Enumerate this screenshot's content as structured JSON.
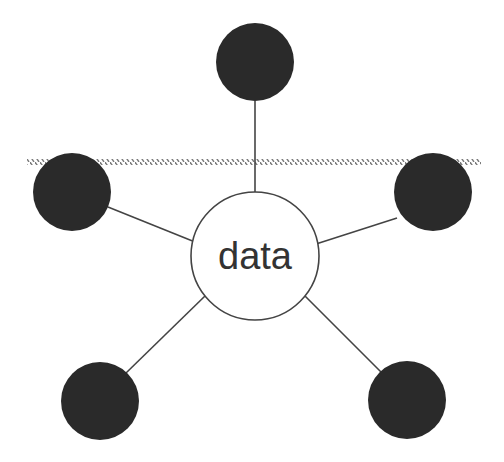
{
  "diagram": {
    "type": "hub-and-spoke",
    "center": {
      "label": "data",
      "cx": 255,
      "cy": 256,
      "r": 64,
      "fill": "#ffffff",
      "stroke": "#444444"
    },
    "satellites": [
      {
        "id": "top",
        "cx": 255,
        "cy": 62,
        "r": 39
      },
      {
        "id": "left",
        "cx": 72,
        "cy": 192,
        "r": 39
      },
      {
        "id": "right",
        "cx": 433,
        "cy": 192,
        "r": 39
      },
      {
        "id": "bottom-left",
        "cx": 100,
        "cy": 401,
        "r": 39
      },
      {
        "id": "bottom-right",
        "cx": 407,
        "cy": 400,
        "r": 39
      }
    ],
    "satellite_fill": "#2a2a2a",
    "connector_color": "#444444",
    "boundary_line": {
      "y": 162,
      "x_start": 27,
      "x_end": 481,
      "style": "hatched",
      "color": "#777777"
    }
  }
}
